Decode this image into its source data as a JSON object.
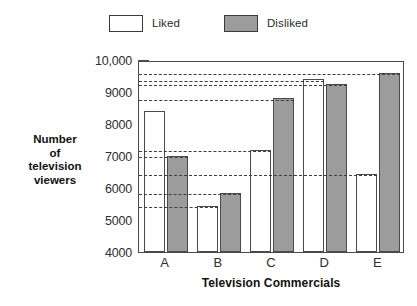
{
  "legend": {
    "position": "top-center",
    "entries": [
      {
        "label": "Liked",
        "swatch": "white-square-icon",
        "color": "#ffffff"
      },
      {
        "label": "Disliked",
        "swatch": "gray-square-icon",
        "color": "#9c9c9c"
      }
    ]
  },
  "axes": {
    "y_title_lines": [
      "Number",
      "of",
      "television",
      "viewers"
    ],
    "x_title": "Television Commercials"
  },
  "chart_data": {
    "type": "bar",
    "title": "",
    "subtitle": "",
    "xlabel": "Television Commercials",
    "ylabel": "Number of television viewers",
    "categories": [
      "A",
      "B",
      "C",
      "D",
      "E"
    ],
    "series": [
      {
        "name": "Liked",
        "color": "#ffffff",
        "values": [
          8400,
          5450,
          7200,
          9400,
          6450
        ]
      },
      {
        "name": "Disliked",
        "color": "#9c9c9c",
        "values": [
          7000,
          5850,
          8800,
          9250,
          9600
        ]
      }
    ],
    "ylim": [
      4000,
      10000
    ],
    "ytick_labels": [
      "4000",
      "5000",
      "6000",
      "7000",
      "8000",
      "9000",
      "10,000"
    ],
    "ytick_values": [
      4000,
      5000,
      6000,
      7000,
      8000,
      9000,
      10000
    ],
    "yminor_interval": 250,
    "grid": false,
    "guide_lines": [
      5450,
      5850,
      6450,
      7000,
      7200,
      8800,
      9250,
      9400,
      9600
    ],
    "legend_position": "top-center"
  }
}
